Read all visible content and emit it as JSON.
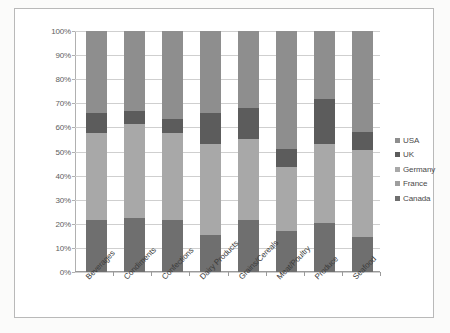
{
  "chart_data": {
    "type": "bar",
    "subtype": "stacked-100-percent",
    "title": "",
    "xlabel": "",
    "ylabel": "",
    "ylim": [
      0,
      100
    ],
    "grid": true,
    "legend_position": "right",
    "ytick_labels": [
      "100%",
      "90%",
      "80%",
      "70%",
      "60%",
      "50%",
      "40%",
      "30%",
      "20%",
      "10%",
      "0%"
    ],
    "ytick_values": [
      100,
      90,
      80,
      70,
      60,
      50,
      40,
      30,
      20,
      10,
      0
    ],
    "categories": [
      "Beverages",
      "Condiments",
      "Confections",
      "Dairy Products",
      "Grains/Cereals",
      "Meat/Poultry",
      "Produce",
      "Seafood"
    ],
    "series": [
      {
        "name": "Canada",
        "color": "#6f6f6f",
        "values": [
          21.5,
          22.5,
          21.5,
          15.5,
          21.5,
          17.0,
          20.5,
          14.5
        ]
      },
      {
        "name": "France",
        "color": "#9e9e9e",
        "values": [
          0,
          0,
          0,
          0,
          0,
          0,
          0,
          0
        ]
      },
      {
        "name": "Germany",
        "color": "#a8a8a8",
        "values": [
          36.0,
          39.0,
          36.0,
          37.5,
          33.5,
          26.5,
          32.5,
          36.0
        ]
      },
      {
        "name": "UK",
        "color": "#5c5c5c",
        "values": [
          8.5,
          5.5,
          6.0,
          13.0,
          13.0,
          7.5,
          19.0,
          7.5
        ]
      },
      {
        "name": "USA",
        "color": "#8e8e8e",
        "values": [
          34.0,
          33.0,
          36.5,
          34.0,
          32.0,
          49.0,
          28.0,
          42.0
        ]
      }
    ],
    "legend_entries": [
      {
        "label": "USA",
        "color": "#8e8e8e"
      },
      {
        "label": "UK",
        "color": "#5c5c5c"
      },
      {
        "label": "Germany",
        "color": "#a8a8a8"
      },
      {
        "label": "France",
        "color": "#9e9e9e"
      },
      {
        "label": "Canada",
        "color": "#6f6f6f"
      }
    ]
  }
}
